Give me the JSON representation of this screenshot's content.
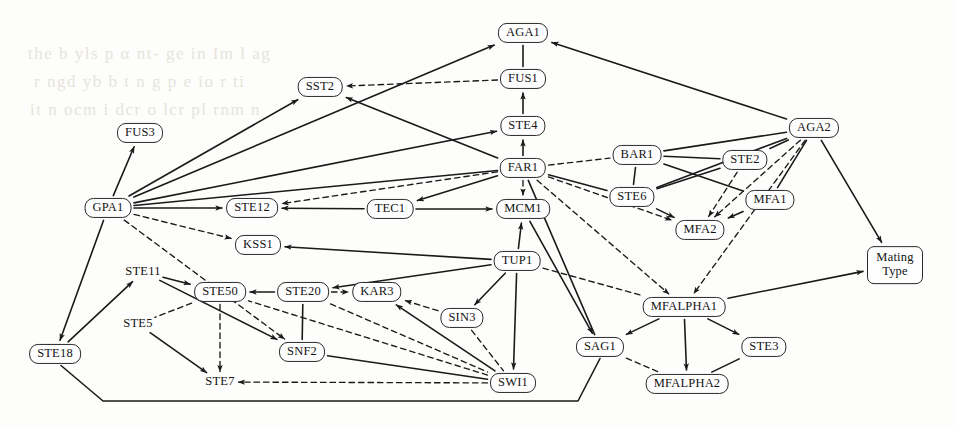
{
  "figure": {
    "type": "directed-graph",
    "title": "",
    "background_text": [
      "the b yls p  α nt- ge  in   Im l  ag",
      "r  ngd  yb   b  t  n  g  p  e   io r  ti",
      "it   n ocm  i dcr    o lcr  pl rnm   n"
    ]
  },
  "legend": {
    "solid_label": "",
    "dashed_label": ""
  },
  "nodes": [
    {
      "id": "FUS3",
      "label": "FUS3",
      "x": 140,
      "y": 133,
      "shape": "rounded"
    },
    {
      "id": "SST2",
      "label": "SST2",
      "x": 320,
      "y": 87,
      "shape": "rounded"
    },
    {
      "id": "AGA1",
      "label": "AGA1",
      "x": 523,
      "y": 33,
      "shape": "rounded"
    },
    {
      "id": "FUS1",
      "label": "FUS1",
      "x": 523,
      "y": 79,
      "shape": "rounded"
    },
    {
      "id": "STE4",
      "label": "STE4",
      "x": 523,
      "y": 126,
      "shape": "rounded"
    },
    {
      "id": "FAR1",
      "label": "FAR1",
      "x": 523,
      "y": 168,
      "shape": "rounded"
    },
    {
      "id": "MCM1",
      "label": "MCM1",
      "x": 523,
      "y": 209,
      "shape": "rounded"
    },
    {
      "id": "GPA1",
      "label": "GPA1",
      "x": 108,
      "y": 208,
      "shape": "rounded"
    },
    {
      "id": "STE12",
      "label": "STE12",
      "x": 252,
      "y": 208,
      "shape": "rounded"
    },
    {
      "id": "TEC1",
      "label": "TEC1",
      "x": 390,
      "y": 209,
      "shape": "rounded"
    },
    {
      "id": "AGA2",
      "label": "AGA2",
      "x": 814,
      "y": 128,
      "shape": "rounded"
    },
    {
      "id": "BAR1",
      "label": "BAR1",
      "x": 637,
      "y": 155,
      "shape": "rounded"
    },
    {
      "id": "STE2",
      "label": "STE2",
      "x": 745,
      "y": 160,
      "shape": "rounded"
    },
    {
      "id": "STE6",
      "label": "STE6",
      "x": 632,
      "y": 197,
      "shape": "rounded"
    },
    {
      "id": "MFA1",
      "label": "MFA1",
      "x": 770,
      "y": 200,
      "shape": "rounded"
    },
    {
      "id": "MFA2",
      "label": "MFA2",
      "x": 700,
      "y": 230,
      "shape": "rounded"
    },
    {
      "id": "KSS1",
      "label": "KSS1",
      "x": 258,
      "y": 245,
      "shape": "rounded"
    },
    {
      "id": "TUP1",
      "label": "TUP1",
      "x": 517,
      "y": 261,
      "shape": "rounded"
    },
    {
      "id": "MatingType",
      "label": "Mating Type",
      "x": 895,
      "y": 265,
      "shape": "rect-two-line"
    },
    {
      "id": "STE11",
      "label": "STE11",
      "x": 143,
      "y": 272,
      "shape": "bare"
    },
    {
      "id": "STE50",
      "label": "STE50",
      "x": 220,
      "y": 292,
      "shape": "rounded"
    },
    {
      "id": "STE20",
      "label": "STE20",
      "x": 303,
      "y": 292,
      "shape": "rounded"
    },
    {
      "id": "KAR3",
      "label": "KAR3",
      "x": 377,
      "y": 292,
      "shape": "rounded"
    },
    {
      "id": "MFALPHA1",
      "label": "MFALPHA1",
      "x": 684,
      "y": 307,
      "shape": "rounded"
    },
    {
      "id": "SIN3",
      "label": "SIN3",
      "x": 462,
      "y": 318,
      "shape": "rounded"
    },
    {
      "id": "STE5",
      "label": "STE5",
      "x": 138,
      "y": 324,
      "shape": "bare"
    },
    {
      "id": "SAG1",
      "label": "SAG1",
      "x": 600,
      "y": 347,
      "shape": "rounded"
    },
    {
      "id": "STE3",
      "label": "STE3",
      "x": 764,
      "y": 347,
      "shape": "rounded"
    },
    {
      "id": "SNF2",
      "label": "SNF2",
      "x": 302,
      "y": 352,
      "shape": "rounded"
    },
    {
      "id": "STE18",
      "label": "STE18",
      "x": 55,
      "y": 354,
      "shape": "rounded"
    },
    {
      "id": "STE7",
      "label": "STE7",
      "x": 220,
      "y": 382,
      "shape": "bare"
    },
    {
      "id": "SWI1",
      "label": "SWI1",
      "x": 513,
      "y": 383,
      "shape": "rounded"
    },
    {
      "id": "MFALPHA2",
      "label": "MFALPHA2",
      "x": 687,
      "y": 384,
      "shape": "rounded"
    }
  ],
  "edges": [
    {
      "from": "GPA1",
      "to": "FUS3",
      "style": "solid",
      "arrow": "end"
    },
    {
      "from": "GPA1",
      "to": "SST2",
      "style": "solid",
      "arrow": "end"
    },
    {
      "from": "GPA1",
      "to": "AGA1",
      "style": "solid",
      "arrow": "end"
    },
    {
      "from": "GPA1",
      "to": "STE4",
      "style": "solid",
      "arrow": "end"
    },
    {
      "from": "GPA1",
      "to": "STE12",
      "style": "solid",
      "arrow": "end"
    },
    {
      "from": "GPA1",
      "to": "FAR1",
      "style": "solid",
      "arrow": "none"
    },
    {
      "from": "GPA1",
      "to": "KSS1",
      "style": "dashed",
      "arrow": "end"
    },
    {
      "from": "GPA1",
      "to": "SNF2",
      "style": "dashed",
      "arrow": "end"
    },
    {
      "from": "GPA1",
      "to": "STE18",
      "style": "solid",
      "arrow": "end"
    },
    {
      "from": "FAR1",
      "to": "STE12",
      "style": "dashed",
      "arrow": "end"
    },
    {
      "from": "FAR1",
      "to": "SST2",
      "style": "solid",
      "arrow": "end"
    },
    {
      "from": "FAR1",
      "to": "STE4",
      "style": "solid",
      "arrow": "end"
    },
    {
      "from": "FAR1",
      "to": "TEC1",
      "style": "solid",
      "arrow": "end"
    },
    {
      "from": "FAR1",
      "to": "MCM1",
      "style": "dashed",
      "arrow": "end"
    },
    {
      "from": "FAR1",
      "to": "BAR1",
      "style": "dashed",
      "arrow": "none"
    },
    {
      "from": "FAR1",
      "to": "STE6",
      "style": "solid",
      "arrow": "none"
    },
    {
      "from": "FAR1",
      "to": "MFA2",
      "style": "dashed",
      "arrow": "end"
    },
    {
      "from": "FAR1",
      "to": "MFALPHA1",
      "style": "dashed",
      "arrow": "end"
    },
    {
      "from": "FAR1",
      "to": "SAG1",
      "style": "solid",
      "arrow": "none"
    },
    {
      "from": "STE4",
      "to": "FUS1",
      "style": "solid",
      "arrow": "end"
    },
    {
      "from": "FUS1",
      "to": "AGA1",
      "style": "solid",
      "arrow": "none"
    },
    {
      "from": "FUS1",
      "to": "SST2",
      "style": "dashed",
      "arrow": "end"
    },
    {
      "from": "AGA2",
      "to": "AGA1",
      "style": "solid",
      "arrow": "end"
    },
    {
      "from": "AGA2",
      "to": "BAR1",
      "style": "solid",
      "arrow": "none"
    },
    {
      "from": "AGA2",
      "to": "STE2",
      "style": "solid",
      "arrow": "none"
    },
    {
      "from": "AGA2",
      "to": "STE6",
      "style": "solid",
      "arrow": "none"
    },
    {
      "from": "AGA2",
      "to": "MFA1",
      "style": "solid",
      "arrow": "none"
    },
    {
      "from": "AGA2",
      "to": "MFA2",
      "style": "dashed",
      "arrow": "end"
    },
    {
      "from": "AGA2",
      "to": "MFALPHA1",
      "style": "dashed",
      "arrow": "end"
    },
    {
      "from": "AGA2",
      "to": "MatingType",
      "style": "solid",
      "arrow": "end"
    },
    {
      "from": "BAR1",
      "to": "STE2",
      "style": "solid",
      "arrow": "none"
    },
    {
      "from": "BAR1",
      "to": "STE6",
      "style": "solid",
      "arrow": "none"
    },
    {
      "from": "BAR1",
      "to": "MFA1",
      "style": "solid",
      "arrow": "none"
    },
    {
      "from": "STE2",
      "to": "STE6",
      "style": "solid",
      "arrow": "none"
    },
    {
      "from": "STE2",
      "to": "MFA2",
      "style": "dashed",
      "arrow": "end"
    },
    {
      "from": "STE6",
      "to": "MFA2",
      "style": "solid",
      "arrow": "end"
    },
    {
      "from": "MFA1",
      "to": "MFA2",
      "style": "solid",
      "arrow": "end"
    },
    {
      "from": "TEC1",
      "to": "STE12",
      "style": "solid",
      "arrow": "end"
    },
    {
      "from": "TEC1",
      "to": "MCM1",
      "style": "solid",
      "arrow": "end"
    },
    {
      "from": "TUP1",
      "to": "MCM1",
      "style": "solid",
      "arrow": "end"
    },
    {
      "from": "TUP1",
      "to": "KSS1",
      "style": "solid",
      "arrow": "end"
    },
    {
      "from": "TUP1",
      "to": "STE20",
      "style": "solid",
      "arrow": "end"
    },
    {
      "from": "TUP1",
      "to": "SIN3",
      "style": "solid",
      "arrow": "end"
    },
    {
      "from": "TUP1",
      "to": "SWI1",
      "style": "solid",
      "arrow": "end"
    },
    {
      "from": "TUP1",
      "to": "MFALPHA1",
      "style": "dashed",
      "arrow": "none"
    },
    {
      "from": "MCM1",
      "to": "SAG1",
      "style": "solid",
      "arrow": "end"
    },
    {
      "from": "STE11",
      "to": "STE50",
      "style": "solid",
      "arrow": "end"
    },
    {
      "from": "STE11",
      "to": "SNF2",
      "style": "solid",
      "arrow": "end"
    },
    {
      "from": "STE18",
      "to": "STE11",
      "style": "solid",
      "arrow": "end"
    },
    {
      "from": "STE18",
      "to": "SAG1",
      "style": "solid",
      "arrow": "none"
    },
    {
      "from": "STE20",
      "to": "STE50",
      "style": "solid",
      "arrow": "end"
    },
    {
      "from": "STE20",
      "to": "KAR3",
      "style": "dashed",
      "arrow": "end"
    },
    {
      "from": "STE20",
      "to": "SNF2",
      "style": "solid",
      "arrow": "none"
    },
    {
      "from": "STE20",
      "to": "SWI1",
      "style": "dashed",
      "arrow": "none"
    },
    {
      "from": "STE50",
      "to": "STE7",
      "style": "dashed",
      "arrow": "end"
    },
    {
      "from": "STE50",
      "to": "STE5",
      "style": "dashed",
      "arrow": "none"
    },
    {
      "from": "STE5",
      "to": "STE7",
      "style": "solid",
      "arrow": "end"
    },
    {
      "from": "SIN3",
      "to": "KAR3",
      "style": "dashed",
      "arrow": "end"
    },
    {
      "from": "SIN3",
      "to": "SWI1",
      "style": "dashed",
      "arrow": "none"
    },
    {
      "from": "SWI1",
      "to": "KAR3",
      "style": "solid",
      "arrow": "end"
    },
    {
      "from": "SWI1",
      "to": "STE50",
      "style": "dashed",
      "arrow": "none"
    },
    {
      "from": "SWI1",
      "to": "STE7",
      "style": "dashed",
      "arrow": "end"
    },
    {
      "from": "SWI1",
      "to": "SNF2",
      "style": "solid",
      "arrow": "none"
    },
    {
      "from": "MFALPHA1",
      "to": "SAG1",
      "style": "solid",
      "arrow": "end"
    },
    {
      "from": "MFALPHA1",
      "to": "STE3",
      "style": "solid",
      "arrow": "end"
    },
    {
      "from": "MFALPHA1",
      "to": "MFALPHA2",
      "style": "solid",
      "arrow": "end"
    },
    {
      "from": "MFALPHA1",
      "to": "MatingType",
      "style": "solid",
      "arrow": "end"
    },
    {
      "from": "STE3",
      "to": "MFALPHA2",
      "style": "solid",
      "arrow": "none"
    },
    {
      "from": "SAG1",
      "to": "MFALPHA2",
      "style": "dashed",
      "arrow": "none"
    }
  ],
  "colors": {
    "node_stroke": "#2a2a2a",
    "node_fill": "#fefefe",
    "edge_solid": "#1a1a1a",
    "edge_dashed": "#1a1a1a",
    "background": "#fdfdfb",
    "bleed_text": "#e6e4dd"
  }
}
